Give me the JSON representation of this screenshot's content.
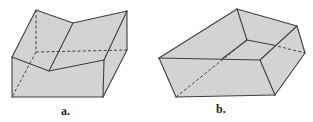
{
  "figures": [
    {
      "id": "a",
      "label": "a.",
      "description": "Prism with V-notched (folded) top surface",
      "label_pos": [
        61,
        115
      ]
    },
    {
      "id": "b",
      "label": "b.",
      "description": "Irregular pentagonal-based solid (truncated prism)",
      "label_pos": [
        216,
        113
      ]
    }
  ],
  "colors": {
    "face_fill": "#d3d3d3",
    "edge_stroke": "#3f3f3f",
    "background": "#ffffff"
  }
}
